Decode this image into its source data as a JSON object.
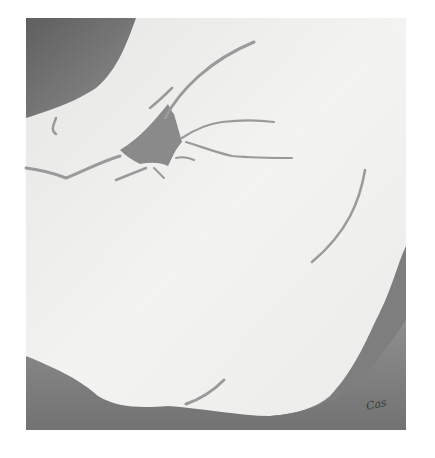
{
  "artwork": {
    "signature": "Cas",
    "colors": {
      "background": "#ffffff",
      "figure": "#eeeeec",
      "shadow_dark": "#727272",
      "shadow_mid": "#8a8a8a",
      "line": "#9a9a9a"
    }
  }
}
